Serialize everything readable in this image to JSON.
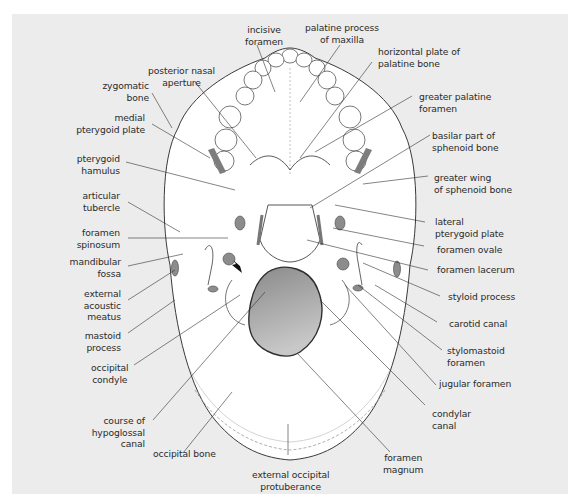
{
  "figure": {
    "colors": {
      "background": "#ffffff",
      "panel": "#ececec",
      "bone_fill": "#ffffff",
      "outline": "#3a3a3a",
      "foramen_fill": "#8c8c8c",
      "foramen_magnum_fill": "#9a9a9a",
      "leader_line": "#333333",
      "text": "#2b2b2b"
    }
  },
  "labels": {
    "incisive_foramen": "incisive\nforamen",
    "palatine_process_of_maxilla": "palatine process\nof maxilla",
    "horizontal_plate_of_palatine_bone": "horizontal plate of\npalatine bone",
    "posterior_nasal_aperture": "posterior nasal\naperture",
    "zygomatic_bone": "zygomatic bone",
    "greater_palatine_foramen": "greater palatine\nforamen",
    "medial_pterygoid_plate": "medial\npterygoid plate",
    "basilar_part_of_sphenoid_bone": "basilar part of\nsphenoid bone",
    "pterygoid_hamulus": "pterygoid\nhamulus",
    "greater_wing_of_sphenoid_bone": "greater wing\nof sphenoid bone",
    "articular_tubercle": "articular\ntubercle",
    "lateral_pterygoid_plate": "lateral\npterygoid plate",
    "foramen_spinosum": "foramen\nspinosum",
    "foramen_ovale": "foramen ovale",
    "mandibular_fossa": "mandibular\nfossa",
    "foramen_lacerum": "foramen lacerum",
    "external_acoustic_meatus": "external\nacoustic\nmeatus",
    "styloid_process": "styloid process",
    "mastoid_process": "mastoid\nprocess",
    "carotid_canal": "carotid canal",
    "stylomastoid_foramen": "stylomastoid\nforamen",
    "occipital_condyle": "occipital\ncondyle",
    "jugular_foramen": "jugular foramen",
    "course_of_hypoglossal_canal": "course of\nhypoglossal\ncanal",
    "condylar_canal": "condylar\ncanal",
    "occipital_bone": "occipital bone",
    "foramen_magnum": "foramen\nmagnum",
    "external_occipital_protuberance": "external occipital\nprotuberance"
  }
}
